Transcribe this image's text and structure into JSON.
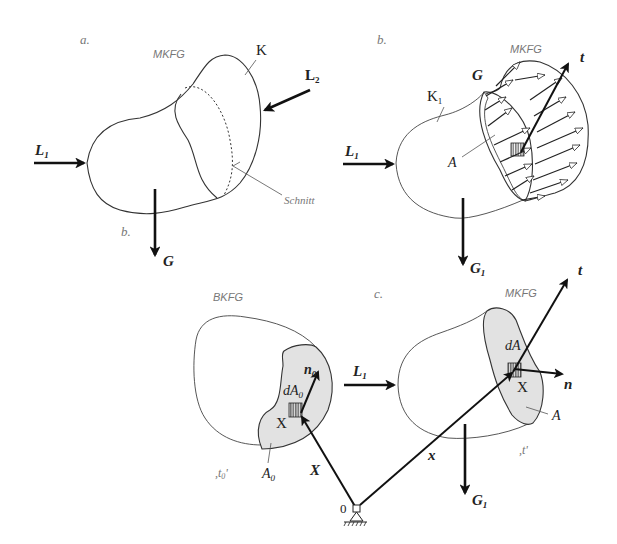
{
  "figure": {
    "panels": {
      "a": {
        "panel_label": "a.",
        "config_label": "MKFG",
        "body_label": "K",
        "forces": {
          "L1": {
            "main": "L",
            "sub": "1"
          },
          "L2": {
            "main": "L",
            "sub": "2"
          },
          "G": "G"
        },
        "cut_label": "Schnitt",
        "sub_label": "b."
      },
      "b": {
        "panel_label": "b.",
        "config_label": "MKFG",
        "body_label": {
          "main": "K",
          "sub": "1"
        },
        "forces": {
          "L1": {
            "main": "L",
            "sub": "1"
          },
          "G": "G",
          "G1": {
            "main": "G",
            "sub": "1"
          },
          "t": "t"
        },
        "area_label": "A"
      },
      "c_left": {
        "config_label": "BKFG",
        "time_label": ",t₀'",
        "time_main": ",t",
        "time_sub": "0",
        "time_end": "'",
        "area_label": {
          "main": "A",
          "sub": "0"
        },
        "normal_label": {
          "main": "n",
          "sub": "0"
        },
        "element_label": {
          "main": "dA",
          "sub": "0"
        },
        "point_label": "X",
        "position_label": "X"
      },
      "c_right": {
        "panel_label": "c.",
        "config_label": "MKFG",
        "time_label": ",t'",
        "area_label": "A",
        "element_label": "dA",
        "point_label": "X",
        "normal_label": "n",
        "traction_label": "t",
        "position_label": "x",
        "forces": {
          "L1": {
            "main": "L",
            "sub": "1"
          },
          "G1": {
            "main": "G",
            "sub": "1"
          }
        }
      },
      "origin": {
        "label": "0"
      }
    },
    "colors": {
      "line": "#333333",
      "shade": "#e2e2e2",
      "label_grey": "#777777",
      "background": "#ffffff"
    }
  }
}
